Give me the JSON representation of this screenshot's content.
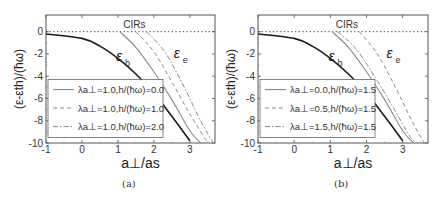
{
  "panels": [
    {
      "id": "a",
      "caption": "(a)",
      "annotation": "CIRs",
      "curve_label_b": "ε",
      "curve_label_b_sub": "b",
      "curve_label_e": "ε",
      "curve_label_e_sub": "e",
      "ylabel": "(ε-ε_th)/(ħω)",
      "xlabel": "a_⊥/a_s",
      "legend": [
        {
          "text": "λa⊥=1.0,h/(ħω)=0.0",
          "style": "solid"
        },
        {
          "text": "λa⊥=1.0,h/(ħω)=1.0",
          "style": "dashed"
        },
        {
          "text": "λa⊥=1.0,h/(ħω)=2.0",
          "style": "dashdot"
        }
      ]
    },
    {
      "id": "b",
      "caption": "(b)",
      "annotation": "CIRs",
      "curve_label_b": "ε",
      "curve_label_b_sub": "b",
      "curve_label_e": "ε",
      "curve_label_e_sub": "e",
      "ylabel": "(ε-ε_th)/(ħω)",
      "xlabel": "a_⊥/a_s",
      "legend": [
        {
          "text": "λa⊥=0.0,h/(ħω)=1.5",
          "style": "solid"
        },
        {
          "text": "λa⊥=0.5,h/(ħω)=1.5",
          "style": "dashed"
        },
        {
          "text": "λa⊥=1.5,h/(ħω)=1.5",
          "style": "dashdot"
        }
      ]
    }
  ],
  "chart_data": [
    {
      "type": "line",
      "title": "(a)",
      "xlabel": "a⊥/as",
      "ylabel": "(ε-εth)/(ħω)",
      "xlim": [
        -1,
        3.7
      ],
      "ylim": [
        -10,
        1.5
      ],
      "xticks": [
        -1,
        0,
        1,
        2,
        3
      ],
      "yticks": [
        0,
        -2,
        -4,
        -6,
        -8,
        -10
      ],
      "grid": false,
      "legend_position": "lower left",
      "annotations": [
        "CIRs",
        "εb",
        "εe"
      ],
      "reference_line": {
        "y": 0,
        "style": "dotted"
      },
      "series": [
        {
          "name": "εb",
          "style": "solid-black",
          "x": [
            -1,
            0,
            0.5,
            1,
            1.5,
            2,
            2.5,
            3
          ],
          "y": [
            -0.2,
            -0.6,
            -1.3,
            -2.4,
            -3.8,
            -5.5,
            -7.6,
            -9.8
          ]
        },
        {
          "name": "λa⊥=1.0,h/(ħω)=0.0",
          "style": "solid-gray",
          "x": [
            1.05,
            1.5,
            2.0,
            2.5,
            3.0,
            3.3
          ],
          "y": [
            0,
            -1.4,
            -3.6,
            -6.1,
            -8.9,
            -10
          ]
        },
        {
          "name": "λa⊥=1.0,h/(ħω)=1.0",
          "style": "dashed-gray",
          "x": [
            1.5,
            2.0,
            2.5,
            3.0,
            3.5
          ],
          "y": [
            0,
            -1.8,
            -4.5,
            -7.4,
            -10
          ]
        },
        {
          "name": "λa⊥=1.0,h/(ħω)=2.0",
          "style": "dashdot-gray",
          "x": [
            1.8,
            2.3,
            2.8,
            3.3,
            3.65
          ],
          "y": [
            0,
            -1.8,
            -4.7,
            -8.0,
            -10
          ]
        }
      ]
    },
    {
      "type": "line",
      "title": "(b)",
      "xlabel": "a⊥/as",
      "ylabel": "(ε-εth)/(ħω)",
      "xlim": [
        -1,
        3.7
      ],
      "ylim": [
        -10,
        1.5
      ],
      "xticks": [
        -1,
        0,
        1,
        2,
        3
      ],
      "yticks": [
        0,
        -2,
        -4,
        -6,
        -8,
        -10
      ],
      "grid": false,
      "legend_position": "lower left",
      "annotations": [
        "CIRs",
        "εb",
        "εe"
      ],
      "reference_line": {
        "y": 0,
        "style": "dotted"
      },
      "series": [
        {
          "name": "εb",
          "style": "solid-black",
          "x": [
            -1,
            0,
            0.5,
            1,
            1.5,
            2,
            2.5,
            3
          ],
          "y": [
            -0.2,
            -0.6,
            -1.3,
            -2.4,
            -3.8,
            -5.5,
            -7.6,
            -9.8
          ]
        },
        {
          "name": "λa⊥=0.0,h/(ħω)=1.5",
          "style": "solid-gray",
          "x": [
            1.05,
            1.5,
            2.0,
            2.5,
            3.0,
            3.3
          ],
          "y": [
            0,
            -1.4,
            -3.6,
            -6.1,
            -8.9,
            -10
          ]
        },
        {
          "name": "λa⊥=0.5,h/(ħω)=1.5",
          "style": "dashed-gray",
          "x": [
            1.8,
            2.3,
            2.8,
            3.3,
            3.6
          ],
          "y": [
            0,
            -2.0,
            -5.0,
            -8.3,
            -10
          ]
        },
        {
          "name": "λa⊥=1.5,h/(ħω)=1.5",
          "style": "dashdot-gray",
          "x": [
            1.2,
            1.7,
            2.2,
            2.7,
            3.2,
            3.4
          ],
          "y": [
            0,
            -1.5,
            -3.9,
            -6.6,
            -9.4,
            -10
          ]
        }
      ]
    }
  ]
}
